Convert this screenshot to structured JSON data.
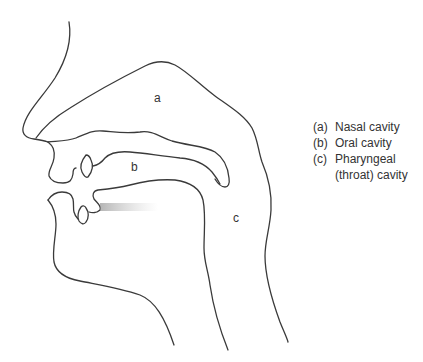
{
  "diagram": {
    "type": "anatomical cross-section of the vocal tract",
    "region_labels": {
      "a": "a",
      "b": "b",
      "c": "c"
    },
    "legend": [
      {
        "key": "(a)",
        "text": "Nasal cavity"
      },
      {
        "key": "(b)",
        "text": "Oral cavity"
      },
      {
        "key": "(c)",
        "text": "Pharyngeal"
      },
      {
        "key": "",
        "text": "(throat) cavity"
      }
    ],
    "colors": {
      "outline": "#3a3a3a",
      "text": "#333333",
      "airflow": "#9a9a9a"
    }
  }
}
